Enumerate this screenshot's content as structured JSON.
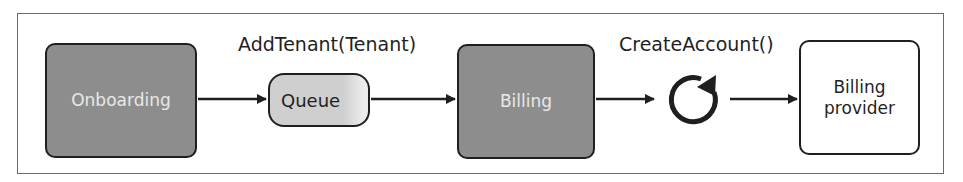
{
  "diagram": {
    "nodes": {
      "onboarding": "Onboarding",
      "queue": "Queue",
      "billing": "Billing",
      "billing_provider_line1": "Billing",
      "billing_provider_line2": "provider"
    },
    "edge_labels": {
      "add_tenant": "AddTenant(Tenant)",
      "create_account": "CreateAccount()"
    },
    "icons": {
      "loop": "refresh-cycle-icon"
    },
    "colors": {
      "dark_box_fill": "#8d8d8d",
      "dark_box_text": "#e8e8e8",
      "queue_fill": "#cfcfcf",
      "stroke": "#1f1f1f",
      "frame": "#6a6a6a"
    }
  }
}
